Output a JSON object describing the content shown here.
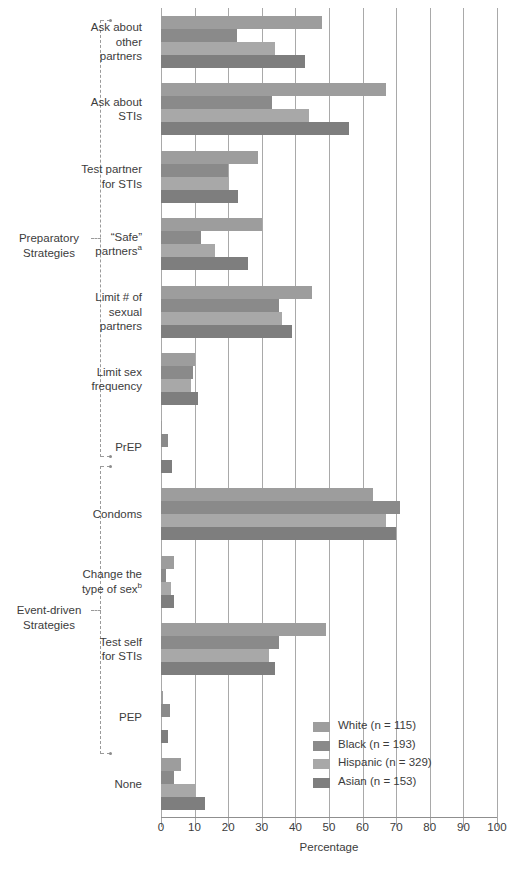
{
  "chart_data": {
    "type": "bar",
    "orientation": "horizontal",
    "title": "",
    "xlabel": "Percentage",
    "ylabel": "",
    "xlim": [
      0,
      100
    ],
    "xticks": [
      0,
      10,
      20,
      30,
      40,
      50,
      60,
      70,
      80,
      90,
      100
    ],
    "grid": true,
    "legend_position": "bottom-right",
    "categories": [
      "Ask about other partners",
      "Ask about STIs",
      "Test partner for STIs",
      "\"Safe\" partners",
      "Limit # of sexual partners",
      "Limit sex frequency",
      "PrEP",
      "Condoms",
      "Change the type of sex",
      "Test self for STIs",
      "PEP",
      "None"
    ],
    "series": [
      {
        "name": "White",
        "label": "White (n = 115)",
        "color": "#9d9d9d",
        "values": [
          48,
          67,
          29,
          30,
          45,
          10,
          0.4,
          63,
          4,
          49,
          0.6,
          6
        ]
      },
      {
        "name": "Black",
        "label": "Black (n = 193)",
        "color": "#8a8a8a",
        "values": [
          22.5,
          33,
          20,
          12,
          35,
          9.5,
          2.2,
          71,
          1.5,
          35,
          2.6,
          4
        ]
      },
      {
        "name": "Hispanic",
        "label": "Hispanic (n = 329)",
        "color": "#a8a8a8",
        "values": [
          34,
          44,
          20,
          16,
          36,
          9,
          0.4,
          67,
          3,
          32,
          0.4,
          10
        ]
      },
      {
        "name": "Asian",
        "label": "Asian (n = 153)",
        "color": "#7e7e7e",
        "values": [
          43,
          56,
          23,
          26,
          39,
          11,
          3.4,
          70,
          4,
          34,
          2,
          13
        ]
      }
    ]
  },
  "axis": {
    "x_title": "Percentage",
    "tick_labels": [
      "0",
      "10",
      "20",
      "30",
      "40",
      "50",
      "60",
      "70",
      "80",
      "90",
      "100"
    ]
  },
  "category_labels": [
    {
      "lines": [
        "Ask about",
        "other",
        "partners"
      ],
      "sup": ""
    },
    {
      "lines": [
        "Ask about",
        "STIs"
      ],
      "sup": ""
    },
    {
      "lines": [
        "Test partner",
        "for STIs"
      ],
      "sup": ""
    },
    {
      "lines": [
        "“Safe”",
        "partners"
      ],
      "sup": "a"
    },
    {
      "lines": [
        "Limit # of",
        "sexual",
        "partners"
      ],
      "sup": ""
    },
    {
      "lines": [
        "Limit sex",
        "frequency"
      ],
      "sup": ""
    },
    {
      "lines": [
        "PrEP"
      ],
      "sup": ""
    },
    {
      "lines": [
        "Condoms"
      ],
      "sup": ""
    },
    {
      "lines": [
        "Change the",
        "type of sex"
      ],
      "sup": "b"
    },
    {
      "lines": [
        "Test self",
        "for STIs"
      ],
      "sup": ""
    },
    {
      "lines": [
        "PEP"
      ],
      "sup": ""
    },
    {
      "lines": [
        "None"
      ],
      "sup": ""
    }
  ],
  "brackets": [
    {
      "label": "Preparatory\nStrategies",
      "label_lines": [
        "Preparatory",
        "Strategies"
      ]
    },
    {
      "label": "Event-driven\nStrategies",
      "label_lines": [
        "Event-driven",
        "Strategies"
      ]
    }
  ],
  "legend": {
    "entries": [
      {
        "label": "White (n = 115)",
        "color": "#9d9d9d"
      },
      {
        "label": "Black (n = 193)",
        "color": "#8a8a8a"
      },
      {
        "label": "Hispanic (n = 329)",
        "color": "#a8a8a8"
      },
      {
        "label": "Asian (n = 153)",
        "color": "#7e7e7e"
      }
    ]
  }
}
